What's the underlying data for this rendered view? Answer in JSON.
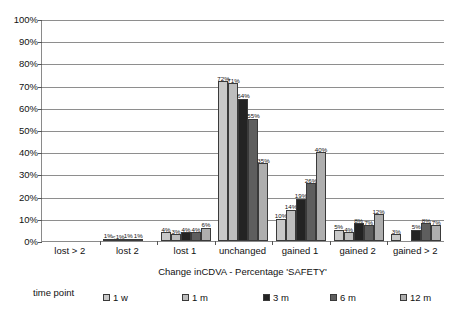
{
  "chart_data": {
    "type": "bar",
    "title": "",
    "xlabel": "Change inCDVA - Percentage 'SAFETY'",
    "ylabel": "",
    "ylim": [
      0,
      100
    ],
    "grid": true,
    "legend_position": "bottom",
    "legend_title": "time point",
    "categories": [
      "lost > 2",
      "lost 2",
      "lost 1",
      "unchanged",
      "gained 1",
      "gained 2",
      "gained > 2"
    ],
    "ytick_labels": [
      "0%",
      "10%",
      "20%",
      "30%",
      "40%",
      "50%",
      "60%",
      "70%",
      "80%",
      "90%",
      "100%"
    ],
    "ytick_values": [
      0,
      10,
      20,
      30,
      40,
      50,
      60,
      70,
      80,
      90,
      100
    ],
    "series": [
      {
        "name": "1 w",
        "color": "#c9c9c9",
        "values": [
          0,
          1,
          4,
          72,
          10,
          5,
          3
        ],
        "labels": [
          "",
          "1%",
          "4%",
          "72%",
          "10%",
          "5%",
          "3%"
        ]
      },
      {
        "name": "1 m",
        "color": "#bdbdbd",
        "values": [
          0,
          0.5,
          3,
          71,
          14,
          4,
          0
        ],
        "labels": [
          "",
          "<1%",
          "3%",
          "71%",
          "14%",
          "4%",
          ""
        ]
      },
      {
        "name": "3 m",
        "color": "#232323",
        "values": [
          0,
          1,
          4,
          64,
          19,
          8,
          5
        ],
        "labels": [
          "",
          "1%",
          "4%",
          "64%",
          "19%",
          "8%",
          "5%"
        ]
      },
      {
        "name": "6 m",
        "color": "#5e5e5e",
        "values": [
          0,
          1,
          4,
          55,
          26,
          7,
          8
        ],
        "labels": [
          "",
          "1%",
          "4%",
          "55%",
          "26%",
          "7%",
          "8%"
        ]
      },
      {
        "name": "12 m",
        "color": "#aeaeae",
        "values": [
          0,
          0,
          6,
          35,
          40,
          12,
          7
        ],
        "labels": [
          "",
          "",
          "6%",
          "35%",
          "40%",
          "12%",
          "7%"
        ]
      }
    ]
  }
}
